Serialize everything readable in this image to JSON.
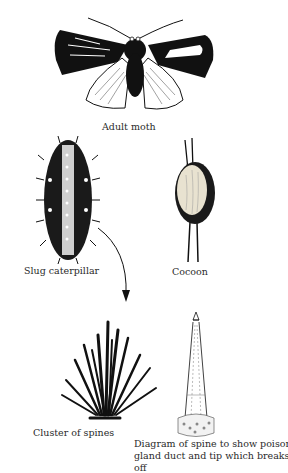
{
  "figure": {
    "stages": [
      {
        "id": "moth",
        "label": "Adult moth"
      },
      {
        "id": "caterpillar",
        "label": "Slug caterpillar"
      },
      {
        "id": "cocoon",
        "label": "Cocoon"
      },
      {
        "id": "spines",
        "label": "Cluster of spines"
      },
      {
        "id": "spine-diagram",
        "label_lines": [
          "Diagram of spine to show poison",
          "gland duct and tip which breaks",
          "off"
        ]
      }
    ],
    "arrows": [
      {
        "from": "caterpillar",
        "to": "spines",
        "icon": "curved-arrow-icon"
      }
    ],
    "colors": {
      "ink": "#111111",
      "paper": "#ffffff"
    }
  }
}
